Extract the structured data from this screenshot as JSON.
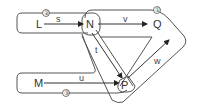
{
  "diagram": {
    "nodes": [
      {
        "id": "L",
        "label": "L"
      },
      {
        "id": "N",
        "label": "N"
      },
      {
        "id": "Q",
        "label": "Q"
      },
      {
        "id": "M",
        "label": "M"
      },
      {
        "id": "P",
        "label": "P"
      }
    ],
    "edges": [
      {
        "from": "L",
        "to": "N",
        "label": "s"
      },
      {
        "from": "N",
        "to": "Q",
        "label": "v"
      },
      {
        "from": "N",
        "to": "P",
        "label": "t"
      },
      {
        "from": "M",
        "to": "P",
        "label": "u"
      },
      {
        "from": "P",
        "to": "Q",
        "label": "w"
      },
      {
        "from": "N",
        "to": "P",
        "label": ""
      }
    ],
    "loops": [
      {
        "label": "①"
      },
      {
        "label": "②"
      },
      {
        "label": "③"
      }
    ],
    "colors": {
      "line": "#444444",
      "background": "#ffffff"
    }
  }
}
